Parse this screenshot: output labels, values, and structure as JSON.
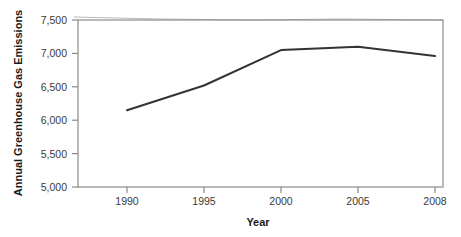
{
  "chart_data": {
    "type": "line",
    "title": "",
    "subtitle": "",
    "xlabel": "Year",
    "ylabel": "Annual Greenhouse Gas Emissions",
    "categories": [
      "1990",
      "1995",
      "2000",
      "2005",
      "2008"
    ],
    "x_tick_labels": [
      "1990",
      "1995",
      "2000",
      "2005",
      "2008"
    ],
    "y_tick_labels": [
      "5,000",
      "5,500",
      "6,000",
      "6,500",
      "7,000",
      "7,500"
    ],
    "y_tick_values": [
      5000,
      5500,
      6000,
      6500,
      7000,
      7500
    ],
    "ylim": [
      5000,
      7500
    ],
    "values": [
      6150,
      6520,
      7050,
      7100,
      6960
    ],
    "series": [
      {
        "name": "Annual Greenhouse Gas Emissions",
        "values": [
          6150,
          6520,
          7050,
          7100,
          6960
        ],
        "color": "#333333"
      }
    ],
    "grid": false,
    "legend": "none",
    "x_spacing": "categorical",
    "line_color": "#333333",
    "axis_color": "#808080"
  },
  "figure": {
    "y_axis_title": "Annual Greenhouse Gas Emissions",
    "x_axis_title": "Year"
  }
}
